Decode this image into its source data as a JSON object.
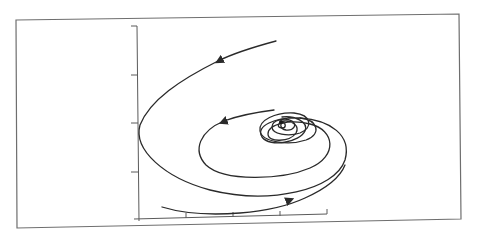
{
  "figure": {
    "type": "phase-portrait",
    "colors": {
      "background": "#ffffff",
      "frame": "#6e6e6e",
      "axis": "#5a5a5a",
      "curve": "#2a2a2a"
    },
    "axes": {
      "x_ticks": 4,
      "y_ticks": 4,
      "x_tick_labels": [],
      "y_tick_labels": []
    },
    "equilibrium": {
      "kind": "stable spiral",
      "position_px": [
        280,
        121
      ]
    },
    "trajectories": [
      {
        "name": "outer-trajectory",
        "start_px": [
          276,
          41
        ],
        "arrow_direction": "left-down"
      },
      {
        "name": "middle-trajectory",
        "start_px": [
          274,
          110
        ],
        "arrow_direction": "left"
      },
      {
        "name": "lower-trajectory",
        "start_px": [
          162,
          207
        ],
        "arrow_direction": "right-up"
      }
    ]
  }
}
